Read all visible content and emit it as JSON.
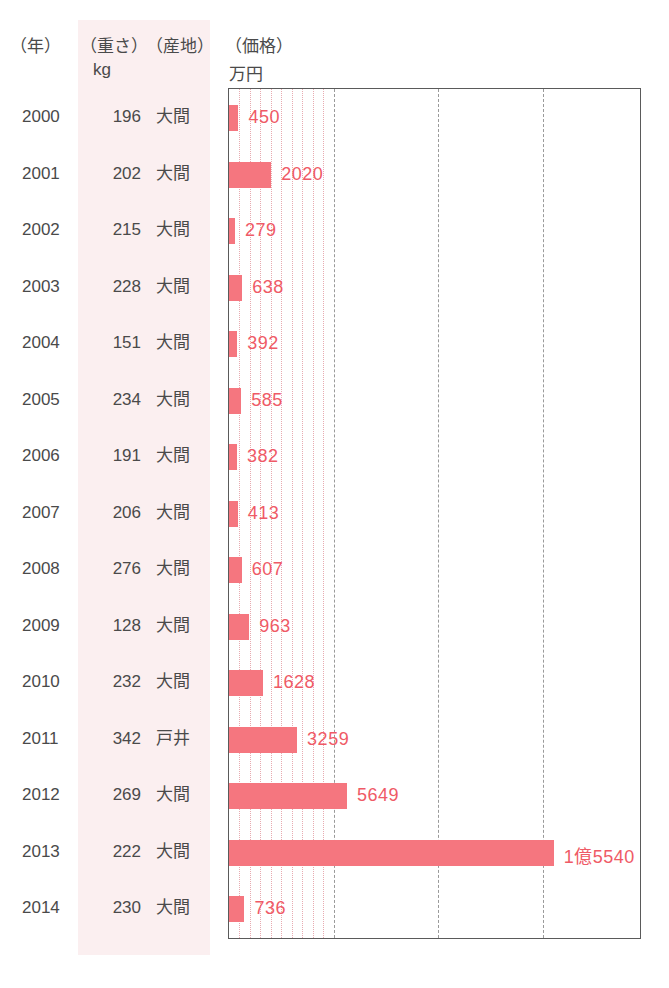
{
  "header": {
    "year": "（年）",
    "weight": "（重さ）",
    "weight_unit": "kg",
    "origin": "（産地）",
    "price": "（価格）",
    "price_unit": "万円"
  },
  "colors": {
    "bar": "#f5767f",
    "bar_label": "#ef5a66",
    "tint_band": "#fbeff0",
    "text": "#4a4a4a",
    "frame": "#5a5a5a",
    "gridline_major": "#9a9a9a",
    "gridline_minor": "#e8aab0"
  },
  "chart_data": {
    "type": "bar",
    "title": "",
    "xlabel": "万円",
    "ylabel": "年",
    "orientation": "horizontal",
    "grid": true,
    "legend": "none",
    "xlim": [
      0,
      18500
    ],
    "major_tick_interval": 5000,
    "minor_tick_interval": 500,
    "categories": [
      "2000",
      "2001",
      "2002",
      "2003",
      "2004",
      "2005",
      "2006",
      "2007",
      "2008",
      "2009",
      "2010",
      "2011",
      "2012",
      "2013",
      "2014"
    ],
    "values": [
      450,
      2020,
      279,
      638,
      392,
      585,
      382,
      413,
      607,
      963,
      1628,
      3259,
      5649,
      15540,
      736
    ],
    "value_labels": [
      "450",
      "2020",
      "279",
      "638",
      "392",
      "585",
      "382",
      "413",
      "607",
      "963",
      "1628",
      "3259",
      "5649",
      "1億5540",
      "736"
    ],
    "weights_kg": [
      196,
      202,
      215,
      228,
      151,
      234,
      191,
      206,
      276,
      128,
      232,
      342,
      269,
      222,
      230
    ],
    "origins": [
      "大間",
      "大間",
      "大間",
      "大間",
      "大間",
      "大間",
      "大間",
      "大間",
      "大間",
      "大間",
      "大間",
      "戸井",
      "大間",
      "大間",
      "大間"
    ]
  },
  "rows": [
    {
      "year": "2000",
      "weight": "196",
      "origin": "大間",
      "label": "450",
      "value": 450
    },
    {
      "year": "2001",
      "weight": "202",
      "origin": "大間",
      "label": "2020",
      "value": 2020
    },
    {
      "year": "2002",
      "weight": "215",
      "origin": "大間",
      "label": "279",
      "value": 279
    },
    {
      "year": "2003",
      "weight": "228",
      "origin": "大間",
      "label": "638",
      "value": 638
    },
    {
      "year": "2004",
      "weight": "151",
      "origin": "大間",
      "label": "392",
      "value": 392
    },
    {
      "year": "2005",
      "weight": "234",
      "origin": "大間",
      "label": "585",
      "value": 585
    },
    {
      "year": "2006",
      "weight": "191",
      "origin": "大間",
      "label": "382",
      "value": 382
    },
    {
      "year": "2007",
      "weight": "206",
      "origin": "大間",
      "label": "413",
      "value": 413
    },
    {
      "year": "2008",
      "weight": "276",
      "origin": "大間",
      "label": "607",
      "value": 607
    },
    {
      "year": "2009",
      "weight": "128",
      "origin": "大間",
      "label": "963",
      "value": 963
    },
    {
      "year": "2010",
      "weight": "232",
      "origin": "大間",
      "label": "1628",
      "value": 1628
    },
    {
      "year": "2011",
      "weight": "342",
      "origin": "戸井",
      "label": "3259",
      "value": 3259
    },
    {
      "year": "2012",
      "weight": "269",
      "origin": "大間",
      "label": "5649",
      "value": 5649
    },
    {
      "year": "2013",
      "weight": "222",
      "origin": "大間",
      "label": "1億5540",
      "value": 15540
    },
    {
      "year": "2014",
      "weight": "230",
      "origin": "大間",
      "label": "736",
      "value": 736
    }
  ]
}
